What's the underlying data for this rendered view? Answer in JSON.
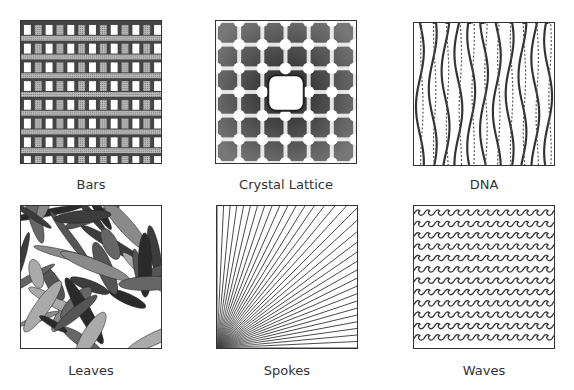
{
  "patterns": [
    {
      "name": "Bars",
      "icon": "bars-pattern"
    },
    {
      "name": "Crystal Lattice",
      "icon": "crystal-lattice-pattern"
    },
    {
      "name": "DNA",
      "icon": "dna-pattern"
    },
    {
      "name": "Leaves",
      "icon": "leaves-pattern"
    },
    {
      "name": "Spokes",
      "icon": "spokes-pattern"
    },
    {
      "name": "Waves",
      "icon": "waves-pattern"
    }
  ],
  "colors": {
    "border": "#333333",
    "gray": "#9a9a9a",
    "dark": "#3a3a3a",
    "background": "#ffffff"
  }
}
